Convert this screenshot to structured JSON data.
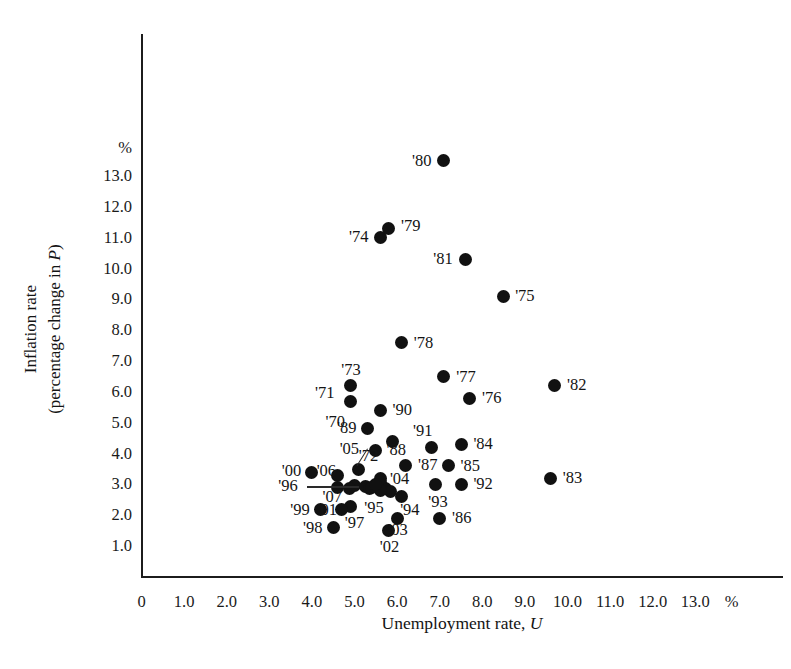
{
  "chart_data": {
    "type": "scatter",
    "title": "",
    "xlabel": "Unemployment rate, U",
    "ylabel": "Inflation rate (percentage change in P)",
    "x_unit_label": "%",
    "y_unit_label": "%",
    "xlim": [
      0,
      13.9
    ],
    "ylim": [
      0,
      13.7
    ],
    "grid": false,
    "legend": "none",
    "xticks": [
      "0",
      "1.0",
      "2.0",
      "3.0",
      "4.0",
      "5.0",
      "6.0",
      "7.0",
      "8.0",
      "9.0",
      "10.0",
      "11.0",
      "12.0",
      "13.0"
    ],
    "xtick_values": [
      0,
      1,
      2,
      3,
      4,
      5,
      6,
      7,
      8,
      9,
      10,
      11,
      12,
      13
    ],
    "yticks": [
      "1.0",
      "2.0",
      "3.0",
      "4.0",
      "5.0",
      "6.0",
      "7.0",
      "8.0",
      "9.0",
      "10.0",
      "11.0",
      "12.0",
      "13.0"
    ],
    "ytick_values": [
      1,
      2,
      3,
      4,
      5,
      6,
      7,
      8,
      9,
      10,
      11,
      12,
      13
    ],
    "point_color": "#111111",
    "points": [
      {
        "label": "'70",
        "x": 4.9,
        "y": 5.7,
        "lx": 4.55,
        "ly": 5.02,
        "leader": false
      },
      {
        "label": "'71",
        "x": 5.9,
        "y": 4.4,
        "lx": 4.3,
        "ly": 5.95,
        "leader": false
      },
      {
        "label": "'72",
        "x": 5.6,
        "y": 3.2,
        "lx": 5.33,
        "ly": 3.93,
        "leader": false
      },
      {
        "label": "'73",
        "x": 4.9,
        "y": 6.2,
        "lx": 4.92,
        "ly": 6.72,
        "leader": false
      },
      {
        "label": "'74",
        "x": 5.6,
        "y": 11.0,
        "lx": 5.1,
        "ly": 11.02,
        "leader": false
      },
      {
        "label": "'75",
        "x": 8.5,
        "y": 9.1,
        "lx": 9.0,
        "ly": 9.12,
        "leader": false
      },
      {
        "label": "'76",
        "x": 7.7,
        "y": 5.8,
        "lx": 8.22,
        "ly": 5.8,
        "leader": false
      },
      {
        "label": "'77",
        "x": 7.1,
        "y": 6.5,
        "lx": 7.62,
        "ly": 6.48,
        "leader": false
      },
      {
        "label": "'78",
        "x": 6.1,
        "y": 7.6,
        "lx": 6.62,
        "ly": 7.6,
        "leader": false
      },
      {
        "label": "'79",
        "x": 5.8,
        "y": 11.3,
        "lx": 6.32,
        "ly": 11.38,
        "leader": false
      },
      {
        "label": "'80",
        "x": 7.1,
        "y": 13.5,
        "lx": 6.58,
        "ly": 13.48,
        "leader": false
      },
      {
        "label": "'81",
        "x": 7.6,
        "y": 10.3,
        "lx": 7.08,
        "ly": 10.32,
        "leader": false
      },
      {
        "label": "'82",
        "x": 9.7,
        "y": 6.2,
        "lx": 10.22,
        "ly": 6.22,
        "leader": false
      },
      {
        "label": "'83",
        "x": 9.6,
        "y": 3.2,
        "lx": 10.12,
        "ly": 3.22,
        "leader": false
      },
      {
        "label": "'84",
        "x": 7.5,
        "y": 4.3,
        "lx": 8.02,
        "ly": 4.3,
        "leader": false
      },
      {
        "label": "'85",
        "x": 7.2,
        "y": 3.6,
        "lx": 7.72,
        "ly": 3.6,
        "leader": false
      },
      {
        "label": "'86",
        "x": 7.0,
        "y": 1.9,
        "lx": 7.52,
        "ly": 1.9,
        "leader": false
      },
      {
        "label": "'87",
        "x": 6.2,
        "y": 3.6,
        "lx": 6.72,
        "ly": 3.62,
        "leader": false
      },
      {
        "label": "'88",
        "x": 5.5,
        "y": 4.1,
        "lx": 5.98,
        "ly": 4.12,
        "leader": false
      },
      {
        "label": "'89",
        "x": 5.3,
        "y": 4.8,
        "lx": 4.82,
        "ly": 4.82,
        "leader": false
      },
      {
        "label": "'90",
        "x": 5.6,
        "y": 5.4,
        "lx": 6.12,
        "ly": 5.4,
        "leader": false
      },
      {
        "label": "'91",
        "x": 6.8,
        "y": 4.2,
        "lx": 6.6,
        "ly": 4.72,
        "leader": false
      },
      {
        "label": "'92",
        "x": 7.5,
        "y": 3.0,
        "lx": 8.02,
        "ly": 3.0,
        "leader": false
      },
      {
        "label": "'93",
        "x": 6.9,
        "y": 3.0,
        "lx": 6.96,
        "ly": 2.44,
        "leader": false
      },
      {
        "label": "'94",
        "x": 6.1,
        "y": 2.6,
        "lx": 6.3,
        "ly": 2.18,
        "leader": false
      },
      {
        "label": "'95",
        "x": 5.6,
        "y": 2.8,
        "lx": 5.46,
        "ly": 2.24,
        "leader": false
      },
      {
        "label": "'96",
        "x": 5.4,
        "y": 2.9,
        "lx": 3.44,
        "ly": 2.94,
        "leader": true,
        "leader_to_x": 5.1,
        "leader_to_y": 2.94
      },
      {
        "label": "'97",
        "x": 4.9,
        "y": 2.3,
        "lx": 5.0,
        "ly": 1.74,
        "leader": false
      },
      {
        "label": "'98",
        "x": 4.5,
        "y": 1.6,
        "lx": 4.02,
        "ly": 1.58,
        "leader": false
      },
      {
        "label": "'99",
        "x": 4.2,
        "y": 2.2,
        "lx": 3.72,
        "ly": 2.18,
        "leader": false
      },
      {
        "label": "'00",
        "x": 4.0,
        "y": 3.4,
        "lx": 3.52,
        "ly": 3.42,
        "leader": false
      },
      {
        "label": "'01",
        "x": 4.7,
        "y": 2.2,
        "lx": 4.36,
        "ly": 2.18,
        "leader": false
      },
      {
        "label": "'02",
        "x": 5.8,
        "y": 1.5,
        "lx": 5.82,
        "ly": 0.98,
        "leader": false
      },
      {
        "label": "'03",
        "x": 6.0,
        "y": 1.9,
        "lx": 6.02,
        "ly": 1.52,
        "leader": false
      },
      {
        "label": "'04",
        "x": 5.5,
        "y": 3.0,
        "lx": 6.06,
        "ly": 3.18,
        "leader": false
      },
      {
        "label": "'05",
        "x": 5.1,
        "y": 3.5,
        "lx": 4.88,
        "ly": 4.16,
        "leader": true,
        "leader_to_x": 5.08,
        "leader_to_y": 3.62
      },
      {
        "label": "'06",
        "x": 4.6,
        "y": 3.3,
        "lx": 4.34,
        "ly": 3.44,
        "leader": false
      },
      {
        "label": "'07",
        "x": 4.6,
        "y": 2.9,
        "lx": 4.48,
        "ly": 2.6,
        "leader": false
      }
    ],
    "extra_points": [
      {
        "x": 5.0,
        "y": 2.95
      },
      {
        "x": 5.25,
        "y": 2.92
      },
      {
        "x": 5.35,
        "y": 2.88
      },
      {
        "x": 5.72,
        "y": 2.88
      },
      {
        "x": 5.85,
        "y": 2.76
      },
      {
        "x": 4.88,
        "y": 2.86
      },
      {
        "x": 5.62,
        "y": 3.05
      }
    ]
  }
}
